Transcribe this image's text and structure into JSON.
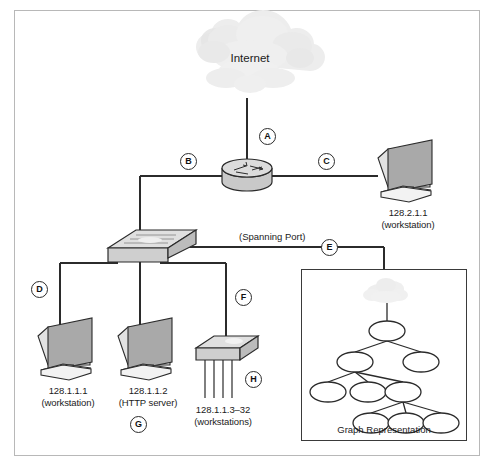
{
  "figure": {
    "border_color": "#b8b8b8"
  },
  "cloud": {
    "label": "Internet",
    "name": "internet-cloud"
  },
  "nodes": [
    {
      "id": "router",
      "type": "router",
      "label": "",
      "sublabel": ""
    },
    {
      "id": "workstation-right",
      "type": "workstation",
      "label": "128.2.1.1",
      "sublabel": "(workstation)"
    },
    {
      "id": "switch",
      "type": "switch",
      "label": "",
      "sublabel": ""
    },
    {
      "id": "workstation-1",
      "type": "workstation",
      "label": "128.1.1.1",
      "sublabel": "(workstation)"
    },
    {
      "id": "http-server",
      "type": "workstation",
      "label": "128.1.1.2",
      "sublabel": "(HTTP server)"
    },
    {
      "id": "hub",
      "type": "hub",
      "label": "128.1.1.3–32",
      "sublabel": "(workstations)"
    }
  ],
  "link_labels": {
    "a": "A",
    "b": "B",
    "c": "C",
    "d": "D",
    "e": "E",
    "f": "F",
    "g": "G",
    "h": "H"
  },
  "annotations": {
    "spanning_port": "(Spanning Port)"
  },
  "inset": {
    "caption": "Graph Representation",
    "cloud_present": true,
    "tree": {
      "nodes": [
        {
          "id": "n0",
          "cx": 387,
          "cy": 294,
          "rx": 13,
          "ry": 9,
          "is_cloud": true
        },
        {
          "id": "n1",
          "cx": 387,
          "cy": 331,
          "rx": 18,
          "ry": 10
        },
        {
          "id": "n2",
          "cx": 355,
          "cy": 362,
          "rx": 18,
          "ry": 10
        },
        {
          "id": "n3",
          "cx": 421,
          "cy": 362,
          "rx": 18,
          "ry": 10
        },
        {
          "id": "n4",
          "cx": 328,
          "cy": 392,
          "rx": 18,
          "ry": 10
        },
        {
          "id": "n5",
          "cx": 368,
          "cy": 392,
          "rx": 18,
          "ry": 10
        },
        {
          "id": "n6",
          "cx": 403,
          "cy": 392,
          "rx": 18,
          "ry": 10
        },
        {
          "id": "n7",
          "cx": 371,
          "cy": 423,
          "rx": 18,
          "ry": 10
        },
        {
          "id": "n8",
          "cx": 406,
          "cy": 423,
          "rx": 18,
          "ry": 10
        },
        {
          "id": "n9",
          "cx": 441,
          "cy": 423,
          "rx": 18,
          "ry": 10
        }
      ],
      "edges": [
        [
          "n0",
          "n1"
        ],
        [
          "n1",
          "n2"
        ],
        [
          "n1",
          "n3"
        ],
        [
          "n2",
          "n4"
        ],
        [
          "n2",
          "n5"
        ],
        [
          "n2",
          "n6"
        ],
        [
          "n6",
          "n7"
        ],
        [
          "n6",
          "n8"
        ],
        [
          "n6",
          "n9"
        ]
      ]
    }
  },
  "colors": {
    "line": "#2b2b2b",
    "device_fill": "#d4d4d4",
    "device_fill_light": "#e6e6e6",
    "device_stroke": "#2b2b2b",
    "screen_fill": "#a8a8a8",
    "cloud_fill": "#ededed",
    "text": "#1b1b1b"
  }
}
